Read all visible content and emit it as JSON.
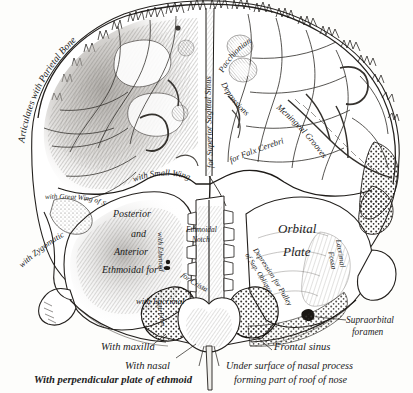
{
  "figure": {
    "ink_color": "#1b1b1b",
    "paper_color": "#fdfdfb"
  },
  "labels": {
    "articulates_parietal": "Articulates with Parietal Bone",
    "pacchionian": "Pacchionian",
    "depressions": "Depressions",
    "sagittal_sinus": "for Superior Sagittal Sinus",
    "meningeal_grooves": "Meningeal Grooves",
    "falx_cerebri": "for Falx Cerebri",
    "small_wing": "with Small Wing",
    "great_wing_sphenoid": "with Great Wing of Sphenoid",
    "with_zygomatic": "with Zygomatic",
    "posterior": "Posterior",
    "and": "and",
    "anterior": "Anterior",
    "ethmoidal_for": "Ethmoidal forª",
    "with_ethmoid": "with Ethmoid",
    "with_lacrimal": "with Lacrimal",
    "ethmoidal_notch_1": "Ethmoidal",
    "ethmoidal_notch_2": "Notch",
    "for_crista": "for Crista",
    "depression_pulley": "Depression for Pulley",
    "depression_pulley_2": "of Sup. Oblique",
    "orbital": "Orbital",
    "plate": "Plate",
    "lacrimal_fossa_1": "Lacrimal",
    "lacrimal_fossa_2": "Fossa",
    "supraorbital_1": "Supraorbital",
    "supraorbital_2": "foramen",
    "with_maxilla": "With maxilla",
    "with_nasal": "With nasal",
    "with_perp_plate": "With perpendicular plate of ethmoid",
    "frontal_sinus": "Frontal sinus",
    "under_surface_1": "Under surface of nasal process",
    "under_surface_2": "forming part of roof of nose"
  }
}
